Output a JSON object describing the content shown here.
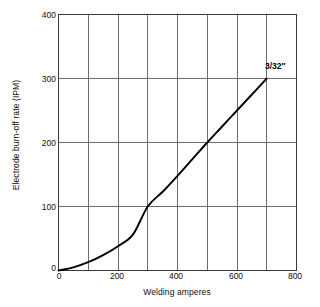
{
  "chart_data": {
    "type": "line",
    "title": "",
    "xlabel": "Welding amperes",
    "ylabel": "Electrode burn-off rate (IPM)",
    "xlim": [
      0,
      800
    ],
    "ylim": [
      0,
      400
    ],
    "grid": true,
    "legend_position": "none",
    "xticks": [
      0,
      200,
      400,
      600,
      800
    ],
    "xtick_labels": [
      "0",
      "200",
      "400",
      "600",
      "800"
    ],
    "x_minor_gridlines": [
      100,
      200,
      300,
      400,
      500,
      600,
      700
    ],
    "yticks": [
      0,
      100,
      200,
      300,
      400
    ],
    "ytick_labels": [
      "0",
      "100",
      "200",
      "300",
      "400"
    ],
    "y_gridlines": [
      100,
      200,
      300
    ],
    "series": [
      {
        "name": "3/32″",
        "annotation": "3/32″",
        "annotation_x": 700,
        "annotation_y": 300,
        "color": "#000000",
        "x": [
          0,
          50,
          100,
          150,
          200,
          250,
          300,
          350,
          400,
          450,
          500,
          550,
          600,
          650,
          700
        ],
        "y": [
          0,
          5,
          13,
          24,
          38,
          56,
          100,
          123,
          148,
          174,
          200,
          225,
          250,
          275,
          300
        ]
      }
    ]
  },
  "axes": {
    "y_title": "Electrode burn-off rate (IPM)",
    "x_title": "Welding amperes",
    "origin_y_label": "0",
    "origin_x_label": "0"
  },
  "ticks": {
    "y": [
      "400",
      "300",
      "200",
      "100"
    ],
    "x": [
      "200",
      "400",
      "600",
      "800"
    ]
  },
  "annotation": {
    "electrode_size": "3/32″"
  },
  "colors": {
    "curve": "#000000",
    "grid": "#6e6e6e",
    "frame": "#3a3a3a",
    "background": "#ffffff",
    "text": "#111111"
  }
}
